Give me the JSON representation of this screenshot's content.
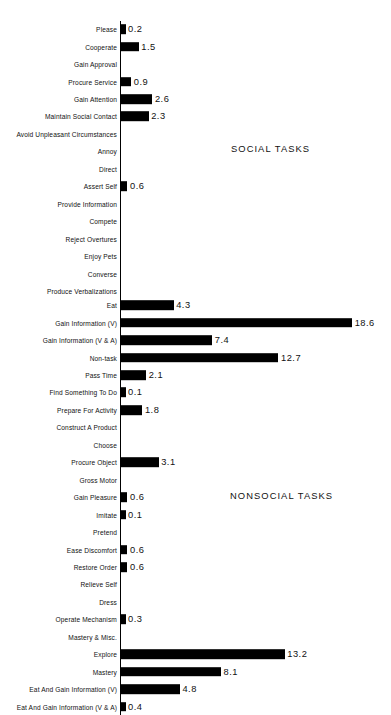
{
  "chart_data": {
    "type": "bar",
    "orientation": "horizontal",
    "title": "",
    "xlabel": "",
    "ylabel": "",
    "xlim": [
      0,
      18.6
    ],
    "grid": false,
    "legend": null,
    "value_unit": "percent",
    "sections": [
      {
        "title": "SOCIAL TASKS",
        "categories": [
          "Please",
          "Cooperate",
          "Gain Approval",
          "Procure Service",
          "Gain Attention",
          "Maintain Social Contact",
          "Avoid Unpleasant Circumstances",
          "Annoy",
          "Direct",
          "Assert Self",
          "Provide Information",
          "Compete",
          "Reject Overtures",
          "Enjoy Pets",
          "Converse",
          "Produce Verbalizations"
        ],
        "values": [
          0.2,
          1.5,
          0,
          0.9,
          2.6,
          2.3,
          0,
          0,
          0,
          0.6,
          0,
          0,
          0,
          0,
          0,
          0
        ],
        "labels": [
          "0.2",
          "1.5",
          "",
          "0.9",
          "2.6",
          "2.3",
          "",
          "",
          "",
          "0.6",
          "",
          "",
          "",
          "",
          "",
          ""
        ]
      },
      {
        "title": "NONSOCIAL TASKS",
        "categories": [
          "Eat",
          "Gain Information (V)",
          "Gain Information (V & A)",
          "Non-task",
          "Pass Time",
          "Find Something To Do",
          "Prepare For Activity",
          "Construct A Product",
          "Choose",
          "Procure Object",
          "Gross Motor",
          "Gain Pleasure",
          "Imitate",
          "Pretend",
          "Ease Discomfort",
          "Restore Order",
          "Relieve Self",
          "Dress",
          "Operate Mechanism",
          "Mastery & Misc.",
          "Explore",
          "Mastery",
          "Eat And Gain Information (V)",
          "Eat And Gain Information (V & A)"
        ],
        "values": [
          4.3,
          18.6,
          7.4,
          12.7,
          2.1,
          0.1,
          1.8,
          0,
          0,
          3.1,
          0,
          0.6,
          0.1,
          0,
          0.6,
          0.6,
          0,
          0,
          0.3,
          0,
          13.2,
          8.1,
          4.8,
          0.4
        ],
        "labels": [
          "4.3",
          "18.6",
          "7.4",
          "12.7",
          "2.1",
          "0.1",
          "1.8",
          "",
          "",
          "3.1",
          "",
          "0.6",
          "0.1",
          "",
          "0.6",
          "0.6",
          "",
          "",
          "0.3",
          "",
          "13.2",
          "8.1",
          "4.8",
          "0.4"
        ]
      }
    ],
    "colors": {
      "bar": "#000000",
      "axis": "#000000",
      "text": "#111111",
      "background": "#ffffff"
    }
  }
}
